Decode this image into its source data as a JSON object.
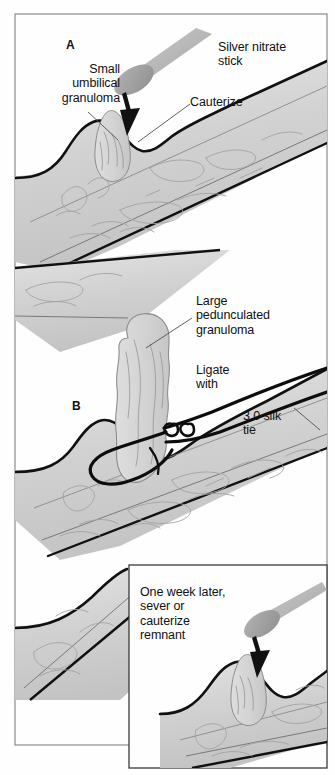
{
  "figure": {
    "background_color": "#fefefe",
    "frame_color": "#8a8a8a",
    "tissue_fill": "#d2d2d2",
    "tissue_fill_light": "#dcdcdc",
    "tissue_outline": "#111111",
    "tissue_detail_line": "#9a9a9a",
    "stick_shaft_color": "#b9b9b9",
    "stick_tip_color": "#a0a0a0",
    "suture_color": "#0d0d0d",
    "leader_line_color": "#5a5a5a",
    "text_color": "#111111"
  },
  "panels": [
    {
      "id": "panel-a",
      "letter": "A",
      "labels": [
        {
          "name": "small-umbilical-granuloma",
          "text": "Small\numbilical\ngranuloma",
          "align": "right"
        },
        {
          "name": "silver-nitrate-stick",
          "text": "Silver nitrate\nstick",
          "align": "left"
        },
        {
          "name": "cauterize",
          "text": "Cauterize",
          "align": "left"
        }
      ]
    },
    {
      "id": "panel-b",
      "letter": "B",
      "labels": [
        {
          "name": "large-pedunculated-granuloma",
          "text": "Large\npedunculated\ngranuloma",
          "align": "left"
        },
        {
          "name": "ligate-with",
          "text": "Ligate\nwith",
          "align": "left"
        },
        {
          "name": "silk-tie",
          "text": "3.0 silk\ntie",
          "align": "left"
        }
      ]
    },
    {
      "id": "panel-inset",
      "letter": "",
      "labels": [
        {
          "name": "one-week-later",
          "text": "One week later,\nsever or\ncauterize\nremnant",
          "align": "left"
        }
      ]
    }
  ],
  "text": {
    "panel_a_letter": "A",
    "panel_b_letter": "B",
    "small_umbilical_granuloma": "Small\numbilical\ngranuloma",
    "silver_nitrate_stick": "Silver nitrate\nstick",
    "cauterize": "Cauterize",
    "large_pedunculated_granuloma": "Large\npedunculated\ngranuloma",
    "ligate_with": "Ligate\nwith",
    "silk_tie": "3.0 silk\ntie",
    "one_week_later": "One week later,\nsever or\ncauterize\nremnant"
  }
}
